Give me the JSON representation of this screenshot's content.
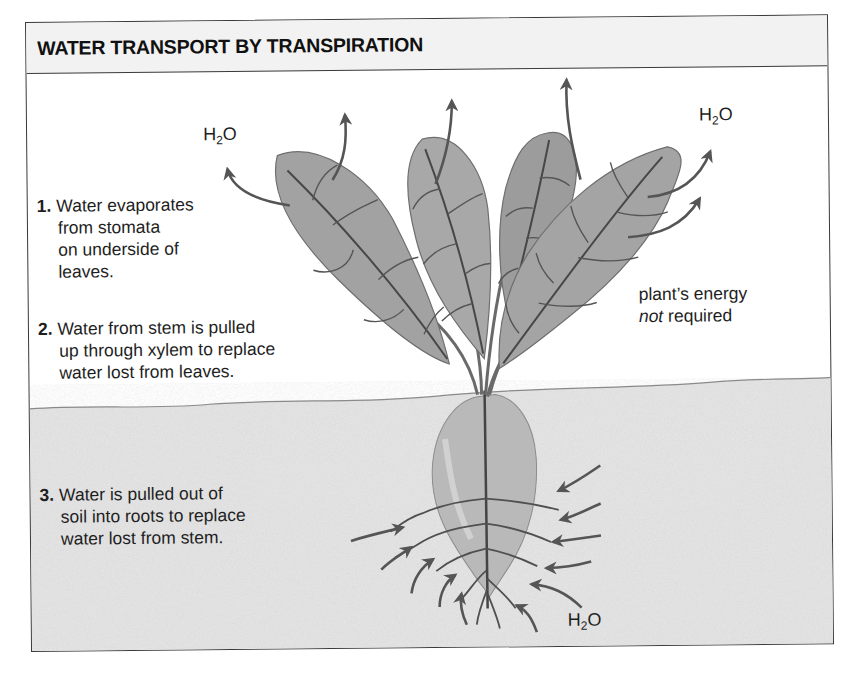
{
  "figure": {
    "title": "WATER TRANSPORT BY TRANSPIRATION",
    "steps": [
      {
        "number": "1.",
        "lines": [
          "Water evaporates",
          "from stomata",
          "on underside of",
          "leaves."
        ]
      },
      {
        "number": "2.",
        "lines": [
          "Water from stem is pulled",
          "up through xylem to replace",
          "water lost from leaves."
        ]
      },
      {
        "number": "3.",
        "lines": [
          "Water is pulled out of",
          "soil into roots to replace",
          "water lost from stem."
        ]
      }
    ],
    "note": {
      "line1": "plant’s energy",
      "line2_italic": "not",
      "line2_rest": " required"
    },
    "water_labels": [
      {
        "base": "H",
        "sub": "2",
        "tail": "O",
        "position": "upper-left"
      },
      {
        "base": "H",
        "sub": "2",
        "tail": "O",
        "position": "upper-right"
      },
      {
        "base": "H",
        "sub": "2",
        "tail": "O",
        "position": "soil"
      }
    ],
    "icons": {
      "evaporation_arrows": "up-arrow-icon",
      "absorption_arrows": "inward-arrow-icon",
      "plant": "beet-plant-illustration"
    },
    "colors": {
      "frame": "#3a3a3a",
      "header_bg": "#f2f2f2",
      "soil": "#e3e3e3",
      "leaf": "#9a9a9a",
      "vein": "#4a4a4a",
      "root": "#b5b5b5",
      "arrow": "#555555"
    }
  }
}
